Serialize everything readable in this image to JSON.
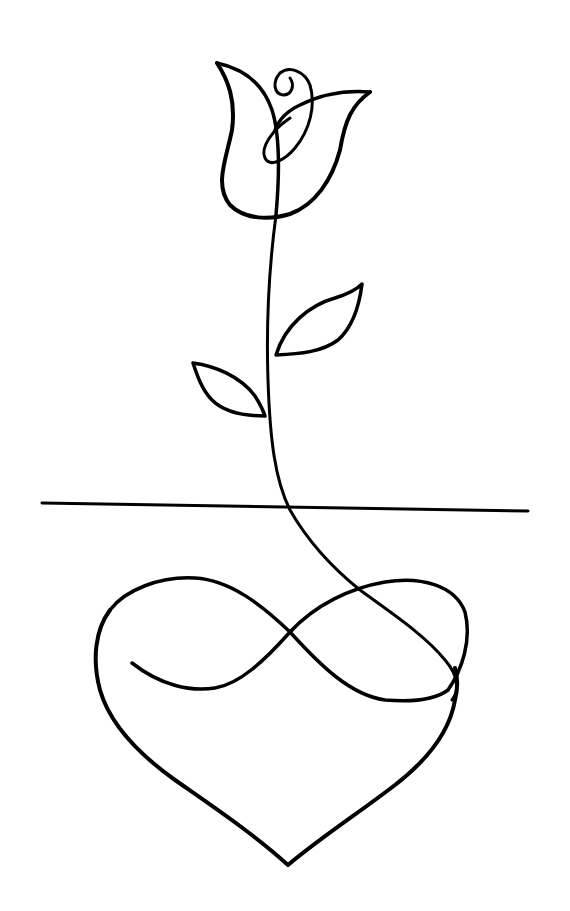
{
  "artwork": {
    "subject": "single-line drawing of a rose growing from an infinity-heart",
    "ink_color": "#000000",
    "background": "#ffffff",
    "elements": [
      "rose-bloom",
      "stem",
      "leaf-right",
      "leaf-left",
      "horizon-line",
      "infinity-loop",
      "heart-outline"
    ]
  }
}
